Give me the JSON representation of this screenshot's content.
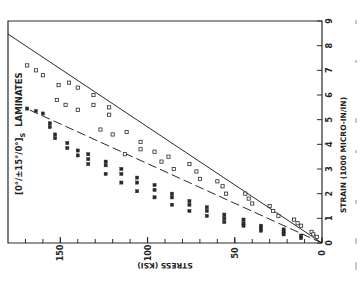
{
  "chart_data": {
    "type": "scatter",
    "orientation": "rotated-90",
    "title_parts": {
      "main": "[0°/±15°/0°]",
      "subscript": "S",
      "suffix": "LAMINATES"
    },
    "xlabel": "STRESS (KSI)",
    "ylabel": "STRAIN (1000 MICRO-IN/IN)",
    "xlim": [
      0,
      180
    ],
    "ylim": [
      0,
      9
    ],
    "x_reversed": true,
    "x_major_ticks": [
      0,
      50,
      100,
      150
    ],
    "x_minor_step": 10,
    "y_ticks": [
      0,
      1,
      2,
      3,
      4,
      5,
      6,
      7,
      8,
      9
    ],
    "grid": false,
    "series": [
      {
        "name": "Upper group (open markers)",
        "marker": "open-square",
        "points": [
          [
            169,
            7.2
          ],
          [
            164,
            7.0
          ],
          [
            160,
            6.8
          ],
          [
            151,
            6.4
          ],
          [
            145,
            6.5
          ],
          [
            140,
            6.3
          ],
          [
            152,
            5.8
          ],
          [
            147,
            5.6
          ],
          [
            140,
            5.4
          ],
          [
            131,
            6.0
          ],
          [
            131,
            5.6
          ],
          [
            122,
            5.5
          ],
          [
            122,
            5.2
          ],
          [
            127,
            4.6
          ],
          [
            120,
            4.4
          ],
          [
            112,
            4.5
          ],
          [
            104,
            4.1
          ],
          [
            104,
            3.8
          ],
          [
            113,
            3.6
          ],
          [
            96,
            3.7
          ],
          [
            92,
            3.3
          ],
          [
            88,
            3.5
          ],
          [
            85,
            3.0
          ],
          [
            76,
            3.2
          ],
          [
            72,
            2.9
          ],
          [
            70,
            2.6
          ],
          [
            60,
            2.5
          ],
          [
            57,
            2.3
          ],
          [
            55,
            2.0
          ],
          [
            44,
            2.0
          ],
          [
            42,
            1.8
          ],
          [
            40,
            1.6
          ],
          [
            30,
            1.5
          ],
          [
            28,
            1.3
          ],
          [
            25,
            1.1
          ],
          [
            16,
            0.95
          ],
          [
            14,
            0.8
          ],
          [
            12,
            0.7
          ],
          [
            6,
            0.45
          ],
          [
            5,
            0.35
          ],
          [
            3,
            0.25
          ]
        ]
      },
      {
        "name": "Lower group (filled markers)",
        "marker": "filled-square",
        "points": [
          [
            169,
            5.45
          ],
          [
            164,
            5.35
          ],
          [
            160,
            5.25
          ],
          [
            156,
            4.85
          ],
          [
            156,
            4.7
          ],
          [
            153,
            4.4
          ],
          [
            153,
            4.25
          ],
          [
            146,
            4.05
          ],
          [
            146,
            3.85
          ],
          [
            140,
            3.75
          ],
          [
            140,
            3.55
          ],
          [
            134,
            3.6
          ],
          [
            134,
            3.4
          ],
          [
            134,
            3.2
          ],
          [
            124,
            3.3
          ],
          [
            124,
            3.15
          ],
          [
            124,
            2.8
          ],
          [
            115,
            3.0
          ],
          [
            115,
            2.8
          ],
          [
            115,
            2.45
          ],
          [
            106,
            2.65
          ],
          [
            106,
            2.45
          ],
          [
            106,
            2.1
          ],
          [
            96,
            2.35
          ],
          [
            96,
            2.15
          ],
          [
            96,
            1.85
          ],
          [
            86,
            2.0
          ],
          [
            86,
            1.85
          ],
          [
            86,
            1.55
          ],
          [
            76,
            1.7
          ],
          [
            76,
            1.55
          ],
          [
            76,
            1.3
          ],
          [
            66,
            1.45
          ],
          [
            66,
            1.3
          ],
          [
            66,
            1.1
          ],
          [
            56,
            1.15
          ],
          [
            56,
            1.0
          ],
          [
            56,
            0.85
          ],
          [
            45,
            0.95
          ],
          [
            45,
            0.8
          ],
          [
            45,
            0.7
          ],
          [
            35,
            0.7
          ],
          [
            35,
            0.6
          ],
          [
            35,
            0.5
          ],
          [
            22,
            0.55
          ],
          [
            22,
            0.45
          ],
          [
            22,
            0.35
          ],
          [
            12,
            0.3
          ],
          [
            12,
            0.2
          ]
        ]
      }
    ],
    "reference_lines": [
      {
        "name": "Upper bound (solid)",
        "style": "solid",
        "from": [
          0,
          0
        ],
        "to": [
          180,
          8.47
        ]
      },
      {
        "name": "Lower fit (dashed)",
        "style": "dashed",
        "from": [
          0,
          0
        ],
        "to": [
          170,
          5.47
        ]
      }
    ]
  },
  "layout": {
    "plot_left_px": 8,
    "plot_right_px": 322,
    "plot_top_px": 21,
    "plot_bottom_px": 243,
    "ink_color": "#2a2a2a",
    "paper_color": "#ffffff"
  }
}
